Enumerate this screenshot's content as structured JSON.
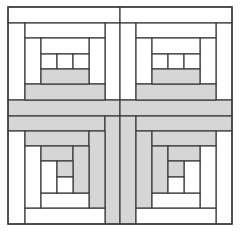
{
  "diagram": {
    "colors": {
      "background": "#ffffff",
      "light": "#ffffff",
      "dark": "#d6d6d6",
      "line": "#3a3a3a"
    },
    "bounds": {
      "x": 8,
      "y": 7,
      "width": 224,
      "height": 217
    },
    "quadrants": [
      {
        "name": "top-left",
        "patches": [
          {
            "x": 8,
            "y": 7,
            "w": 112,
            "h": 16,
            "fill": "light"
          },
          {
            "x": 8,
            "y": 23,
            "w": 17,
            "h": 77,
            "fill": "light"
          },
          {
            "x": 105,
            "y": 23,
            "w": 15,
            "h": 77,
            "fill": "light"
          },
          {
            "x": 8,
            "y": 100,
            "w": 112,
            "h": 16,
            "fill": "dark"
          },
          {
            "x": 25,
            "y": 23,
            "w": 80,
            "h": 15,
            "fill": "light"
          },
          {
            "x": 25,
            "y": 38,
            "w": 16,
            "h": 46,
            "fill": "light"
          },
          {
            "x": 89,
            "y": 38,
            "w": 16,
            "h": 46,
            "fill": "light"
          },
          {
            "x": 25,
            "y": 84,
            "w": 80,
            "h": 16,
            "fill": "dark"
          },
          {
            "x": 41,
            "y": 38,
            "w": 48,
            "h": 16,
            "fill": "light"
          },
          {
            "x": 41,
            "y": 54,
            "w": 16,
            "h": 15,
            "fill": "light"
          },
          {
            "x": 57,
            "y": 54,
            "w": 16,
            "h": 15,
            "fill": "light"
          },
          {
            "x": 73,
            "y": 54,
            "w": 16,
            "h": 15,
            "fill": "light"
          },
          {
            "x": 41,
            "y": 69,
            "w": 48,
            "h": 15,
            "fill": "dark"
          }
        ]
      },
      {
        "name": "top-right",
        "patches": [
          {
            "x": 120,
            "y": 7,
            "w": 112,
            "h": 16,
            "fill": "light"
          },
          {
            "x": 120,
            "y": 23,
            "w": 16,
            "h": 77,
            "fill": "light"
          },
          {
            "x": 216,
            "y": 23,
            "w": 16,
            "h": 77,
            "fill": "light"
          },
          {
            "x": 120,
            "y": 100,
            "w": 112,
            "h": 16,
            "fill": "dark"
          },
          {
            "x": 136,
            "y": 23,
            "w": 80,
            "h": 15,
            "fill": "light"
          },
          {
            "x": 136,
            "y": 38,
            "w": 16,
            "h": 46,
            "fill": "light"
          },
          {
            "x": 200,
            "y": 38,
            "w": 16,
            "h": 46,
            "fill": "light"
          },
          {
            "x": 136,
            "y": 84,
            "w": 80,
            "h": 16,
            "fill": "dark"
          },
          {
            "x": 152,
            "y": 38,
            "w": 48,
            "h": 16,
            "fill": "light"
          },
          {
            "x": 152,
            "y": 54,
            "w": 16,
            "h": 15,
            "fill": "light"
          },
          {
            "x": 168,
            "y": 54,
            "w": 16,
            "h": 15,
            "fill": "light"
          },
          {
            "x": 184,
            "y": 54,
            "w": 16,
            "h": 15,
            "fill": "light"
          },
          {
            "x": 152,
            "y": 69,
            "w": 48,
            "h": 15,
            "fill": "dark"
          }
        ]
      },
      {
        "name": "bottom-left",
        "patches": [
          {
            "x": 8,
            "y": 116,
            "w": 97,
            "h": 15,
            "fill": "dark"
          },
          {
            "x": 105,
            "y": 116,
            "w": 15,
            "h": 108,
            "fill": "dark"
          },
          {
            "x": 8,
            "y": 131,
            "w": 17,
            "h": 93,
            "fill": "light"
          },
          {
            "x": 25,
            "y": 208,
            "w": 80,
            "h": 16,
            "fill": "light"
          },
          {
            "x": 25,
            "y": 131,
            "w": 64,
            "h": 15,
            "fill": "dark"
          },
          {
            "x": 89,
            "y": 131,
            "w": 16,
            "h": 77,
            "fill": "dark"
          },
          {
            "x": 25,
            "y": 146,
            "w": 16,
            "h": 62,
            "fill": "light"
          },
          {
            "x": 41,
            "y": 193,
            "w": 48,
            "h": 15,
            "fill": "light"
          },
          {
            "x": 41,
            "y": 146,
            "w": 32,
            "h": 15,
            "fill": "dark"
          },
          {
            "x": 73,
            "y": 146,
            "w": 16,
            "h": 47,
            "fill": "dark"
          },
          {
            "x": 41,
            "y": 161,
            "w": 16,
            "h": 32,
            "fill": "light"
          },
          {
            "x": 57,
            "y": 161,
            "w": 16,
            "h": 16,
            "fill": "dark"
          },
          {
            "x": 57,
            "y": 177,
            "w": 16,
            "h": 16,
            "fill": "light"
          }
        ]
      },
      {
        "name": "bottom-right",
        "patches": [
          {
            "x": 120,
            "y": 116,
            "w": 16,
            "h": 108,
            "fill": "dark"
          },
          {
            "x": 136,
            "y": 116,
            "w": 96,
            "h": 15,
            "fill": "dark"
          },
          {
            "x": 216,
            "y": 131,
            "w": 16,
            "h": 93,
            "fill": "light"
          },
          {
            "x": 136,
            "y": 208,
            "w": 80,
            "h": 16,
            "fill": "light"
          },
          {
            "x": 136,
            "y": 131,
            "w": 16,
            "h": 77,
            "fill": "dark"
          },
          {
            "x": 152,
            "y": 131,
            "w": 64,
            "h": 15,
            "fill": "dark"
          },
          {
            "x": 200,
            "y": 146,
            "w": 16,
            "h": 62,
            "fill": "light"
          },
          {
            "x": 152,
            "y": 193,
            "w": 48,
            "h": 15,
            "fill": "light"
          },
          {
            "x": 152,
            "y": 146,
            "w": 16,
            "h": 47,
            "fill": "dark"
          },
          {
            "x": 168,
            "y": 146,
            "w": 32,
            "h": 15,
            "fill": "dark"
          },
          {
            "x": 184,
            "y": 161,
            "w": 16,
            "h": 32,
            "fill": "light"
          },
          {
            "x": 168,
            "y": 161,
            "w": 16,
            "h": 16,
            "fill": "dark"
          },
          {
            "x": 168,
            "y": 177,
            "w": 16,
            "h": 16,
            "fill": "light"
          }
        ]
      }
    ]
  }
}
